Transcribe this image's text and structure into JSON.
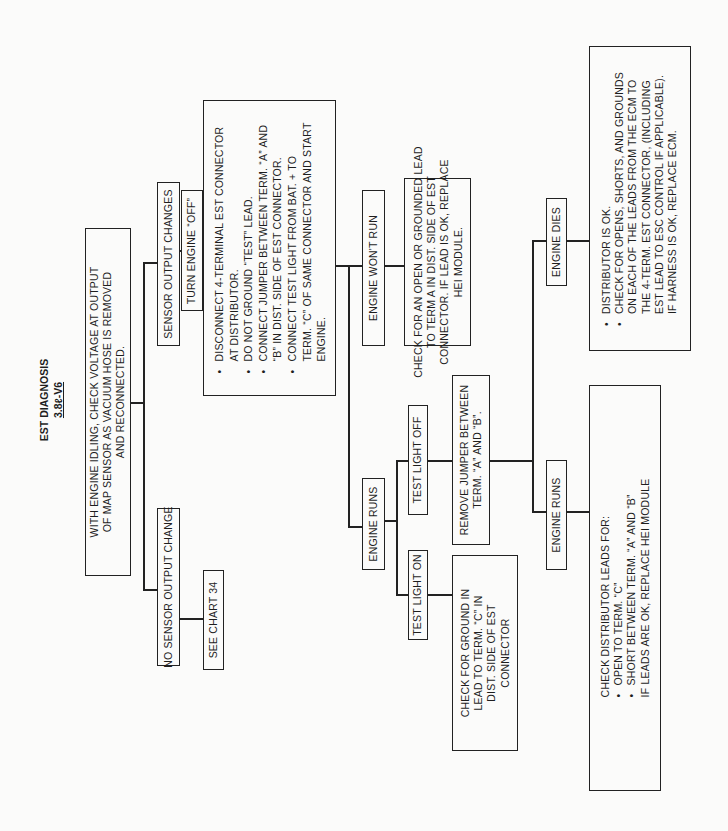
{
  "title": {
    "main": "EST DIAGNOSIS",
    "sub": "3.8ℓ-V6"
  },
  "nodes": {
    "root": {
      "lines": [
        "WITH ENGINE IDLING, CHECK VOLTAGE AT OUTPUT",
        "OF MAP SENSOR AS VACUUM HOSE IS REMOVED",
        "AND RECONNECTED."
      ]
    },
    "no_change": {
      "label": "NO SENSOR OUTPUT CHANGE"
    },
    "see_chart": {
      "label": "SEE CHART 34"
    },
    "changes": {
      "label": "SENSOR OUTPUT CHANGES"
    },
    "turn_off": {
      "label": "TURN ENGINE “OFF”"
    },
    "disconnect": {
      "lines": [
        {
          "bullet": true,
          "text": "DISCONNECT 4-TERMINAL EST CONNECTOR"
        },
        {
          "bullet": false,
          "text": "AT DISTRIBUTOR."
        },
        {
          "bullet": true,
          "text": "DO NOT GROUND “TEST” LEAD."
        },
        {
          "bullet": true,
          "text": "CONNECT JUMPER BETWEEN TERM. “A” AND"
        },
        {
          "bullet": false,
          "text": "“B” IN DIST. SIDE OF EST CONNECTOR."
        },
        {
          "bullet": true,
          "text": "CONNECT TEST LIGHT FROM BAT. + TO"
        },
        {
          "bullet": false,
          "text": "TERM. “C” OF SAME CONNECTOR AND START"
        },
        {
          "bullet": false,
          "text": "ENGINE."
        }
      ]
    },
    "wont_run": {
      "label": "ENGINE WON'T RUN"
    },
    "check_open": {
      "lines": [
        "CHECK FOR AN OPEN OR GROUNDED LEAD",
        "TO TERM A IN DIST. SIDE OF EST",
        "CONNECTOR. IF LEAD IS OK, REPLACE",
        "HEI MODULE."
      ]
    },
    "runs_1": {
      "label": "ENGINE RUNS"
    },
    "light_off": {
      "label": "TEST LIGHT OFF"
    },
    "light_on": {
      "label": "TEST LIGHT ON"
    },
    "remove_jumper": {
      "lines": [
        "REMOVE JUMPER BETWEEN",
        "TERM. “A” AND “B”."
      ]
    },
    "check_ground": {
      "lines": [
        "CHECK FOR GROUND IN",
        "LEAD TO TERM. “C” IN",
        "DIST. SIDE OF EST",
        "CONNECTOR"
      ]
    },
    "dies": {
      "label": "ENGINE DIES"
    },
    "dist_ok": {
      "lines": [
        {
          "bullet": true,
          "text": "DISTRIBUTOR IS OK."
        },
        {
          "bullet": true,
          "text": "CHECK FOR OPENS, SHORTS, AND GROUNDS"
        },
        {
          "bullet": false,
          "text": "ON EACH OF THE LEADS FROM THE ECM TO"
        },
        {
          "bullet": false,
          "text": "THE 4-TERM. EST CONNECTOR, (INCLUDING"
        },
        {
          "bullet": false,
          "text": "EST LEAD TO ESC CONTROL IF APPLICABLE)."
        },
        {
          "bullet": false,
          "text": "IF HARNESS IS OK, REPLACE ECM."
        }
      ]
    },
    "runs_2": {
      "label": "ENGINE RUNS"
    },
    "check_dist": {
      "lines": [
        {
          "bullet": false,
          "text": "CHECK DISTRIBUTOR LEADS FOR:"
        },
        {
          "bullet": true,
          "text": "OPEN TO TERM. “C”"
        },
        {
          "bullet": true,
          "text": "SHORT BETWEEN TERM. “A” AND “B”"
        },
        {
          "bullet": false,
          "text": "IF LEADS ARE OK, REPLACE HEI MODULE"
        }
      ]
    }
  }
}
